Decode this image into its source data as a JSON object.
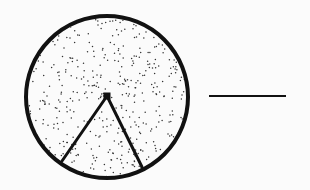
{
  "diagram": {
    "type": "circle-sector",
    "circle": {
      "cx": 107,
      "cy": 97,
      "r": 81,
      "stroke": "#111111",
      "stroke_width": 4,
      "fill": "stippled"
    },
    "center_point": {
      "x": 107,
      "y": 96,
      "size": 7
    },
    "radii": [
      {
        "x1": 107,
        "y1": 96,
        "x2": 62,
        "y2": 161
      },
      {
        "x1": 107,
        "y1": 96,
        "x2": 142,
        "y2": 167
      }
    ],
    "answer_line": {
      "x1": 209,
      "y1": 96,
      "x2": 286,
      "y2": 96,
      "stroke_width": 2
    },
    "colors": {
      "ink": "#111111",
      "paper": "#fbfbfb",
      "stipple": "#333333"
    }
  }
}
